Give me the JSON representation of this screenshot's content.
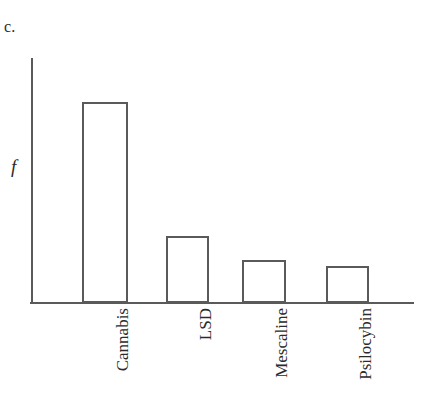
{
  "figure": {
    "panel_letter": "c.",
    "y_axis_label": "f",
    "background_color": "#ffffff",
    "line_color": "#5a5a5a",
    "text_color": "#2b2b2b"
  },
  "chart_data": {
    "type": "bar",
    "title": "",
    "subtitle": "",
    "xlabel": "",
    "ylabel": "f",
    "categories": [
      "Cannabis",
      "LSD",
      "Mescaline",
      "Psilocybin"
    ],
    "values": [
      201,
      67,
      43,
      37
    ],
    "value_unit": "pixels above baseline",
    "ylim": [
      0,
      245
    ],
    "grid": false,
    "legend": null,
    "legend_position": "none",
    "annotations": [
      "c."
    ],
    "bar_style": "unfilled-outline",
    "tick_labels_rotated": true,
    "tick_label_rotation_deg": -90,
    "bars": [
      {
        "label": "Cannabis",
        "value": 201,
        "left": 82,
        "width": 46,
        "top": 102
      },
      {
        "label": "LSD",
        "value": 67,
        "left": 166,
        "width": 43,
        "top": 236
      },
      {
        "label": "Mescaline",
        "value": 43,
        "left": 242,
        "width": 44,
        "top": 260
      },
      {
        "label": "Psilocybin",
        "value": 37,
        "left": 326,
        "width": 43,
        "top": 266
      }
    ]
  }
}
